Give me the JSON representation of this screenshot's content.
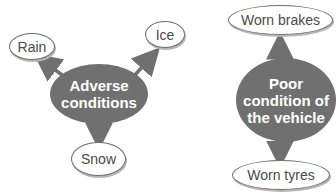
{
  "diagram": {
    "colors": {
      "hub_fill": "#707070",
      "leaf_border": "#6f6f6f",
      "arrow": "#707070",
      "text_dark": "#4a4a4a"
    },
    "left_group": {
      "hub": {
        "label": "Adverse conditions",
        "line1": "Adverse",
        "line2": "conditions"
      },
      "leaves": [
        {
          "label": "Rain"
        },
        {
          "label": "Ice"
        },
        {
          "label": "Snow"
        }
      ]
    },
    "right_group": {
      "hub": {
        "label": "Poor condition of the vehicle",
        "line1": "Poor",
        "line2": "condition of",
        "line3": "the vehicle"
      },
      "leaves": [
        {
          "label": "Worn brakes"
        },
        {
          "label": "Worn tyres"
        }
      ]
    }
  }
}
